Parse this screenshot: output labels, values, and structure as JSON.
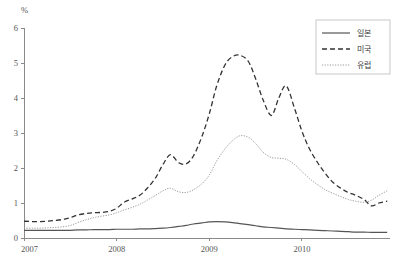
{
  "chart_data": {
    "type": "line",
    "title": "",
    "subtitle": "",
    "xlabel": "",
    "ylabel": "%",
    "unit_label": "%",
    "xlim": [
      2007.0,
      2010.95
    ],
    "ylim": [
      0,
      6
    ],
    "yticks": [
      0,
      1,
      2,
      3,
      4,
      5,
      6
    ],
    "ytick_labels": [
      "0",
      "1",
      "2",
      "3",
      "4",
      "5",
      "6"
    ],
    "xticks": [
      2007,
      2008,
      2009,
      2010
    ],
    "xtick_labels": [
      "2007",
      "2008",
      "2009",
      "2010"
    ],
    "grid": false,
    "legend_position": "top-right",
    "x": [
      2007.0,
      2007.08,
      2007.17,
      2007.25,
      2007.33,
      2007.42,
      2007.5,
      2007.58,
      2007.67,
      2007.75,
      2007.83,
      2007.92,
      2008.0,
      2008.08,
      2008.17,
      2008.25,
      2008.33,
      2008.42,
      2008.5,
      2008.58,
      2008.67,
      2008.75,
      2008.83,
      2008.92,
      2009.0,
      2009.08,
      2009.17,
      2009.25,
      2009.33,
      2009.42,
      2009.5,
      2009.58,
      2009.67,
      2009.75,
      2009.83,
      2009.92,
      2010.0,
      2010.08,
      2010.17,
      2010.25,
      2010.33,
      2010.42,
      2010.5,
      2010.58,
      2010.67,
      2010.75,
      2010.83,
      2010.92
    ],
    "series": [
      {
        "name": "일본",
        "style": "solid",
        "color": "#555555",
        "values": [
          0.22,
          0.22,
          0.22,
          0.22,
          0.22,
          0.22,
          0.22,
          0.23,
          0.23,
          0.24,
          0.24,
          0.24,
          0.25,
          0.25,
          0.25,
          0.26,
          0.26,
          0.27,
          0.28,
          0.3,
          0.33,
          0.36,
          0.4,
          0.43,
          0.46,
          0.47,
          0.46,
          0.44,
          0.41,
          0.38,
          0.35,
          0.32,
          0.3,
          0.28,
          0.26,
          0.25,
          0.24,
          0.23,
          0.22,
          0.21,
          0.2,
          0.19,
          0.18,
          0.17,
          0.17,
          0.16,
          0.16,
          0.16
        ]
      },
      {
        "name": "미국",
        "style": "dashed",
        "color": "#333333",
        "values": [
          0.48,
          0.47,
          0.47,
          0.48,
          0.5,
          0.53,
          0.58,
          0.66,
          0.7,
          0.72,
          0.73,
          0.76,
          0.85,
          1.02,
          1.12,
          1.22,
          1.42,
          1.72,
          2.1,
          2.38,
          2.15,
          2.12,
          2.35,
          2.9,
          3.55,
          4.35,
          4.95,
          5.18,
          5.22,
          5.05,
          4.55,
          3.95,
          3.5,
          4.0,
          4.35,
          3.7,
          3.05,
          2.55,
          2.15,
          1.85,
          1.6,
          1.42,
          1.3,
          1.22,
          1.1,
          0.92,
          1.0,
          1.05
        ]
      },
      {
        "name": "유럽",
        "style": "dotted",
        "color": "#9a9a9a",
        "values": [
          0.28,
          0.28,
          0.28,
          0.29,
          0.3,
          0.32,
          0.36,
          0.44,
          0.52,
          0.58,
          0.62,
          0.66,
          0.72,
          0.8,
          0.88,
          0.96,
          1.08,
          1.22,
          1.35,
          1.42,
          1.32,
          1.3,
          1.38,
          1.55,
          1.8,
          2.2,
          2.55,
          2.78,
          2.92,
          2.88,
          2.7,
          2.45,
          2.3,
          2.28,
          2.25,
          2.1,
          1.9,
          1.7,
          1.52,
          1.38,
          1.28,
          1.18,
          1.1,
          1.05,
          1.02,
          1.08,
          1.22,
          1.35
        ]
      }
    ]
  },
  "legend": {
    "items": [
      {
        "label": "일본",
        "style": "solid"
      },
      {
        "label": "미국",
        "style": "dashed"
      },
      {
        "label": "유럽",
        "style": "dotted"
      }
    ]
  }
}
